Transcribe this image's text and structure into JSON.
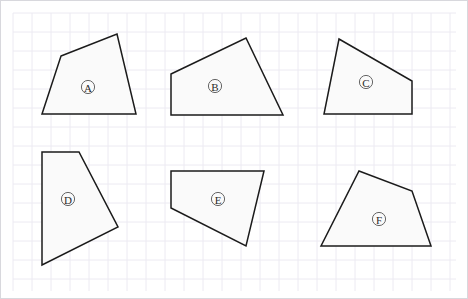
{
  "canvas": {
    "width": 468,
    "height": 299,
    "background_color": "#ffffff",
    "border_color": "#d8d8dd"
  },
  "grid": {
    "visible": true,
    "line_color": "#eceaf2",
    "cell_size": 19,
    "origin_x": 12,
    "origin_y": 12,
    "extent_x": 455,
    "extent_y": 290
  },
  "style": {
    "shape_fill": "#fafafa",
    "shape_stroke": "#1b1b1b",
    "shape_stroke_width": 1.5,
    "label_circle_stroke": "#555555",
    "label_text_color": "#2a2a2a"
  },
  "shapes": [
    {
      "id": "shape-a",
      "label": "A",
      "sides": 4,
      "points": "60,55 116,33 135,113 41,113",
      "label_x": 87,
      "label_y": 86
    },
    {
      "id": "shape-b",
      "label": "B",
      "sides": 4,
      "points": "170,73 245,37 282,114 170,114",
      "label_x": 214,
      "label_y": 85
    },
    {
      "id": "shape-c",
      "label": "C",
      "sides": 4,
      "points": "338,38 411,80 411,113 323,113",
      "label_x": 365,
      "label_y": 81
    },
    {
      "id": "shape-d",
      "label": "D",
      "sides": 4,
      "points": "41,151 78,151 117,226 41,264",
      "label_x": 67,
      "label_y": 198
    },
    {
      "id": "shape-e",
      "label": "E",
      "sides": 4,
      "points": "170,170 263,170 245,245 170,207",
      "label_x": 217,
      "label_y": 198
    },
    {
      "id": "shape-f",
      "label": "F",
      "sides": 4,
      "points": "358,170 411,190 430,245 320,245",
      "label_x": 378,
      "label_y": 218
    }
  ]
}
